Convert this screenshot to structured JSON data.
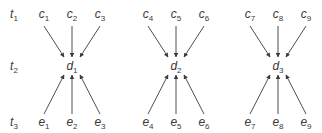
{
  "time_labels": [
    {
      "base": "t",
      "sub": "1"
    },
    {
      "base": "t",
      "sub": "2"
    },
    {
      "base": "t",
      "sub": "3"
    }
  ],
  "groups": [
    {
      "top": [
        {
          "base": "c",
          "sub": "1"
        },
        {
          "base": "c",
          "sub": "2"
        },
        {
          "base": "c",
          "sub": "3"
        }
      ],
      "center": {
        "base": "d",
        "sub": "1"
      },
      "bottom": [
        {
          "base": "e",
          "sub": "1"
        },
        {
          "base": "e",
          "sub": "2"
        },
        {
          "base": "e",
          "sub": "3"
        }
      ]
    },
    {
      "top": [
        {
          "base": "c",
          "sub": "4"
        },
        {
          "base": "c",
          "sub": "5"
        },
        {
          "base": "c",
          "sub": "6"
        }
      ],
      "center": {
        "base": "d",
        "sub": "2"
      },
      "bottom": [
        {
          "base": "e",
          "sub": "4"
        },
        {
          "base": "e",
          "sub": "5"
        },
        {
          "base": "e",
          "sub": "6"
        }
      ]
    },
    {
      "top": [
        {
          "base": "c",
          "sub": "7"
        },
        {
          "base": "c",
          "sub": "8"
        },
        {
          "base": "c",
          "sub": "9"
        }
      ],
      "center": {
        "base": "d",
        "sub": "3"
      },
      "bottom": [
        {
          "base": "e",
          "sub": "7"
        },
        {
          "base": "e",
          "sub": "8"
        },
        {
          "base": "e",
          "sub": "9"
        }
      ]
    }
  ],
  "edges_description": "Each c node points down to its group's d node; each e node points up to its group's d node",
  "colors": {
    "ink": "#3a3a3a",
    "background": "#ffffff"
  }
}
